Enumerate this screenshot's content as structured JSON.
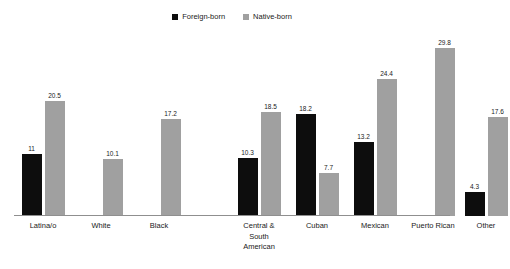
{
  "chart_data": {
    "type": "bar",
    "title": "",
    "subtitle": "",
    "xlabel": "",
    "ylabel": "",
    "ylim": [
      0,
      32
    ],
    "grid": false,
    "legend_position": "top-center",
    "categories": [
      "Latina/o",
      "White",
      "Black",
      "Central &\nSouth\nAmerican",
      "Cuban",
      "Mexican",
      "Puerto Rican",
      "Other"
    ],
    "series": [
      {
        "name": "Foreign-born",
        "color": "#0d0d0d",
        "values": [
          11,
          null,
          null,
          10.3,
          18.2,
          13.2,
          null,
          4.3
        ],
        "labels": [
          "11",
          "",
          "",
          "10.3",
          "18.2",
          "13.2",
          "",
          "4.3"
        ]
      },
      {
        "name": "Native-born",
        "color": "#a0a0a0",
        "values": [
          20.5,
          10.1,
          17.2,
          18.5,
          7.7,
          24.4,
          29.8,
          17.6
        ],
        "labels": [
          "20.5",
          "10.1",
          "17.2",
          "18.5",
          "7.7",
          "24.4",
          "29.8",
          "17.6"
        ]
      }
    ]
  },
  "legend": {
    "items": [
      {
        "label": "Foreign-born",
        "color": "#0d0d0d"
      },
      {
        "label": "Native-born",
        "color": "#a0a0a0"
      }
    ]
  }
}
